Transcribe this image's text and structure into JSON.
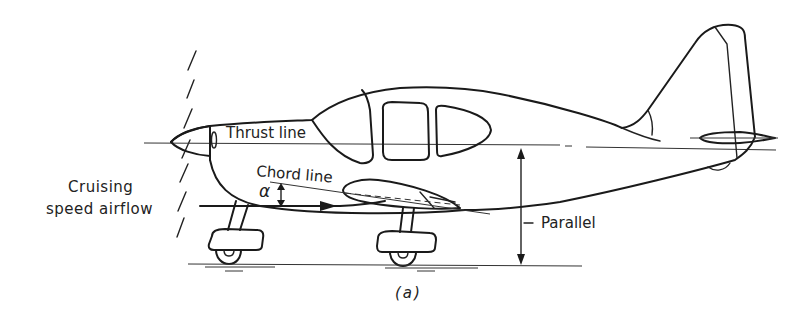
{
  "figure": {
    "caption": "(a)"
  },
  "labels": {
    "thrust_line": "Thrust line",
    "chord_line": "Chord line",
    "alpha": "α",
    "airflow_line1": "Cruising",
    "airflow_line2": "speed airflow",
    "parallel": "Parallel"
  },
  "colors": {
    "ink": "#1a1a1a",
    "background": "#ffffff"
  }
}
